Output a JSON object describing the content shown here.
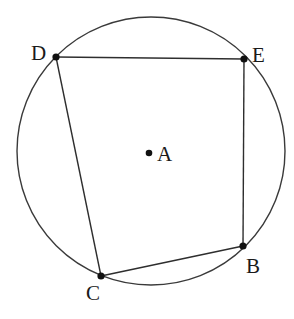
{
  "diagram": {
    "type": "geometry",
    "circle": {
      "center_label": "A",
      "cx": 151,
      "cy": 151,
      "r": 134
    },
    "points": [
      {
        "id": "D",
        "label": "D",
        "x": 56,
        "y": 57,
        "label_x": 31,
        "label_y": 60
      },
      {
        "id": "E",
        "label": "E",
        "x": 244,
        "y": 59,
        "label_x": 252,
        "label_y": 62
      },
      {
        "id": "B",
        "label": "B",
        "x": 243,
        "y": 246,
        "label_x": 246,
        "label_y": 273
      },
      {
        "id": "C",
        "label": "C",
        "x": 101,
        "y": 276,
        "label_x": 86,
        "label_y": 300
      },
      {
        "id": "A",
        "label": "A",
        "x": 149,
        "y": 153,
        "label_x": 157,
        "label_y": 161
      }
    ],
    "edges": [
      [
        "D",
        "E"
      ],
      [
        "E",
        "B"
      ],
      [
        "B",
        "C"
      ],
      [
        "C",
        "D"
      ]
    ],
    "colors": {
      "stroke": "#2e2e2e",
      "point": "#111111",
      "background": "#ffffff"
    }
  }
}
